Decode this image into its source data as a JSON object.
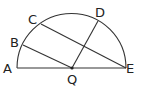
{
  "diagram": {
    "type": "geometry-semicircle",
    "colors": {
      "stroke": "#333333",
      "text": "#222222",
      "background": "#ffffff"
    },
    "center": {
      "x": 71.5,
      "y": 68
    },
    "radius": 54.5,
    "points": {
      "A": {
        "label": "A",
        "x": 17,
        "y": 68,
        "label_x": 3,
        "label_y": 73
      },
      "B": {
        "label": "B",
        "x": 23,
        "y": 45,
        "label_x": 10,
        "label_y": 47
      },
      "C": {
        "label": "C",
        "x": 41,
        "y": 24,
        "label_x": 28,
        "label_y": 24
      },
      "D": {
        "label": "D",
        "x": 98,
        "y": 21,
        "label_x": 95,
        "label_y": 17
      },
      "Q": {
        "label": "Q",
        "x": 72,
        "y": 68,
        "label_x": 67,
        "label_y": 84
      },
      "E": {
        "label": "E",
        "x": 126,
        "y": 68,
        "label_x": 125,
        "label_y": 73
      }
    },
    "segments": [
      {
        "from": "A",
        "to": "E"
      },
      {
        "from": "B",
        "to": "Q"
      },
      {
        "from": "C",
        "to": "E"
      },
      {
        "from": "Q",
        "to": "D"
      }
    ],
    "arc": {
      "from": "A",
      "to": "E",
      "kind": "semicircle"
    }
  }
}
